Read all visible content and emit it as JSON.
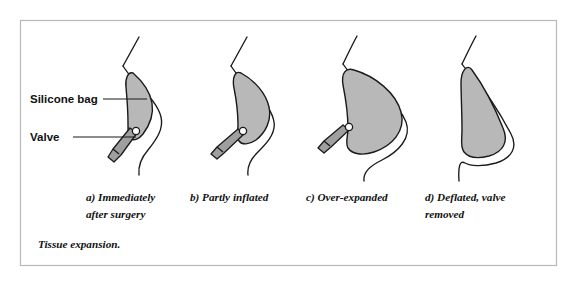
{
  "figure": {
    "title": "Tissue expansion.",
    "frame": {
      "x": 20,
      "y": 20,
      "width": 536,
      "height": 245,
      "border_color": "#b9b9b9"
    },
    "colors": {
      "bag_fill": "#b8b8b8",
      "valve_fill": "#9f9f9f",
      "valve_joint_fill": "#ffffff",
      "outline": "#1a1a1a",
      "background": "#ffffff",
      "frame_border": "#b9b9b9"
    },
    "labels": [
      {
        "id": "silicone-bag",
        "text": "Silicone bag",
        "x": 30,
        "y": 103,
        "leader": {
          "x1": 103,
          "y1": 99,
          "x2": 147,
          "y2": 99
        }
      },
      {
        "id": "valve",
        "text": "Valve",
        "x": 30,
        "y": 141,
        "leader": {
          "x1": 73,
          "y1": 137,
          "x2": 136,
          "y2": 137
        }
      }
    ],
    "panels": [
      {
        "id": "panel-a",
        "caption_lines": [
          "a) Immediately",
          "after surgery"
        ],
        "caption_x": 86,
        "caption_y": 201,
        "state": "Immediately after surgery",
        "bag_state": "narrow crescent, minimally filled",
        "valve_present": true
      },
      {
        "id": "panel-b",
        "caption_lines": [
          "b) Partly inflated"
        ],
        "caption_x": 190,
        "caption_y": 201,
        "state": "Partly inflated",
        "bag_state": "kidney-bean, partially filled",
        "valve_present": true
      },
      {
        "id": "panel-c",
        "caption_lines": [
          "c) Over-expanded"
        ],
        "caption_x": 306,
        "caption_y": 201,
        "state": "Over-expanded",
        "bag_state": "large rounded, over-filled",
        "valve_present": true
      },
      {
        "id": "panel-d",
        "caption_lines": [
          "d) Deflated, valve",
          "removed"
        ],
        "caption_x": 425,
        "caption_y": 201,
        "state": "Deflated, valve removed",
        "bag_state": "teardrop, pendulous",
        "valve_present": false
      }
    ]
  }
}
